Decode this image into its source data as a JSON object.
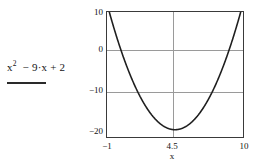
{
  "expression": {
    "base": "x",
    "exponent": "2",
    "rest": "− 9·x + 2",
    "full_text": "x² − 9·x + 2",
    "underline_color": "#2a2a2a"
  },
  "colors": {
    "background": "#ffffff",
    "curve": "#1f1f1f",
    "frame": "#3a3a3a",
    "gridline": "#9a9a9a",
    "text": "#141414"
  },
  "axes": {
    "x_label": "x",
    "y_label": "",
    "x_ticks": [
      "−1",
      "4.5",
      "10"
    ],
    "y_ticks": [
      "10",
      "0",
      "−10",
      "−20"
    ]
  },
  "chart_data": {
    "type": "line",
    "title": "",
    "xlabel": "x",
    "ylabel": "",
    "expression": "x^2 - 9*x + 2",
    "xlim": [
      -1,
      10
    ],
    "ylim": [
      -20,
      10
    ],
    "grid": true,
    "legend": null,
    "xticks": [
      -1,
      4.5,
      10
    ],
    "xticklabels": [
      "−1",
      "4.5",
      "10"
    ],
    "yticks": [
      10,
      0,
      -10,
      -20
    ],
    "yticklabels": [
      "10",
      "0",
      "−10",
      "−20"
    ],
    "gridlines": {
      "horizontal": [
        0,
        -10
      ],
      "vertical": [
        4.5
      ]
    },
    "vertex": {
      "x": 4.5,
      "y": -18.25
    },
    "roots": [
      0.2298,
      8.7702
    ],
    "series": [
      {
        "name": "x^2 - 9·x + 2",
        "x": [
          -1,
          -0.5,
          0,
          0.5,
          1,
          1.5,
          2,
          2.5,
          3,
          3.5,
          4,
          4.5,
          5,
          5.5,
          6,
          6.5,
          7,
          7.5,
          8,
          8.5,
          9,
          9.5,
          10
        ],
        "values": [
          12,
          6.75,
          2,
          -2.25,
          -6,
          -9.25,
          -12,
          -14.25,
          -16,
          -17.25,
          -18,
          -18.25,
          -18,
          -17.25,
          -16,
          -14.25,
          -12,
          -9.25,
          -6,
          -2.25,
          2,
          6.75,
          12
        ]
      }
    ]
  }
}
